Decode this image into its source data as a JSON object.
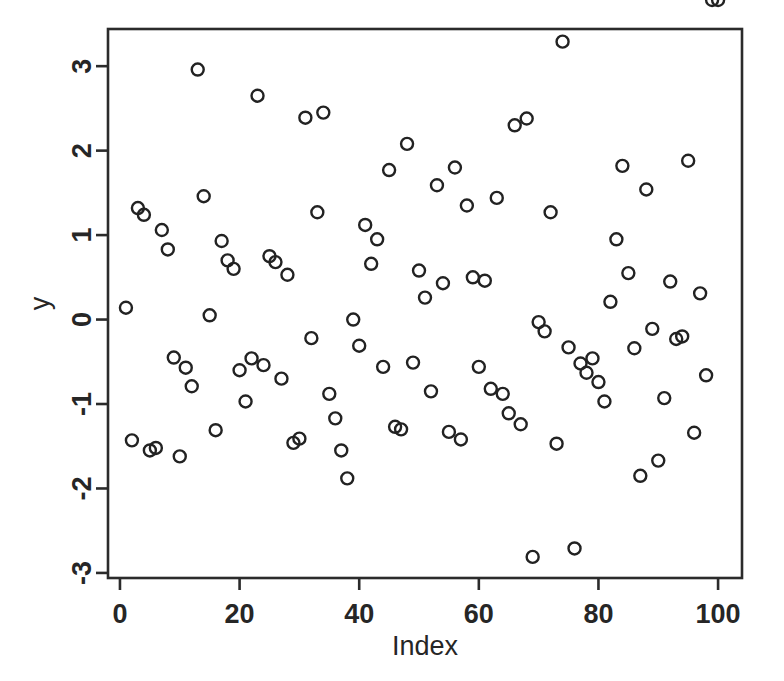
{
  "figure": {
    "background_color": "#ffffff",
    "foreground_color": "#262626",
    "point_color": "#222222",
    "title": ""
  },
  "chart_data": {
    "type": "scatter",
    "title": "",
    "xlabel": "Index",
    "ylabel": "y",
    "xlim": [
      -2,
      104
    ],
    "ylim": [
      -3.06,
      3.44
    ],
    "grid": false,
    "legend": null,
    "marker": "open-circle",
    "xticks": [
      0,
      20,
      40,
      60,
      80,
      100
    ],
    "xtick_labels": [
      "0",
      "20",
      "40",
      "60",
      "80",
      "100"
    ],
    "yticks": [
      -3,
      -2,
      -1,
      0,
      1,
      2,
      3
    ],
    "ytick_labels": [
      "-3",
      "-2",
      "-1",
      "0",
      "1",
      "2",
      "3"
    ],
    "n_points": 100,
    "x": [
      1,
      2,
      3,
      4,
      5,
      6,
      7,
      8,
      9,
      10,
      11,
      12,
      13,
      14,
      15,
      16,
      17,
      18,
      19,
      20,
      21,
      22,
      23,
      24,
      25,
      26,
      27,
      28,
      29,
      30,
      31,
      32,
      33,
      34,
      35,
      36,
      37,
      38,
      39,
      40,
      41,
      42,
      43,
      44,
      45,
      46,
      47,
      48,
      49,
      50,
      51,
      52,
      53,
      54,
      55,
      56,
      57,
      58,
      59,
      60,
      61,
      62,
      63,
      64,
      65,
      66,
      67,
      68,
      69,
      70,
      71,
      72,
      73,
      74,
      75,
      76,
      77,
      78,
      79,
      80,
      81,
      82,
      83,
      84,
      85,
      86,
      87,
      88,
      89,
      90,
      91,
      92,
      93,
      94,
      95,
      96,
      97,
      98,
      99,
      100
    ],
    "y": [
      0.14,
      -1.43,
      1.32,
      1.24,
      -1.55,
      -1.52,
      1.06,
      0.83,
      -0.45,
      -1.62,
      -0.57,
      -0.79,
      2.96,
      1.46,
      0.05,
      -1.31,
      0.93,
      0.7,
      0.6,
      -0.6,
      -0.97,
      -0.46,
      2.65,
      -0.54,
      0.75,
      0.68,
      -0.7,
      0.53,
      -1.46,
      -1.41,
      2.39,
      -0.22,
      1.27,
      2.45,
      -0.88,
      -1.17,
      -1.55,
      -1.88,
      0.0,
      -0.31,
      1.12,
      0.66,
      0.95,
      -0.56,
      1.77,
      -1.27,
      -1.3,
      2.08,
      -0.51,
      0.58,
      0.26,
      -0.85,
      1.59,
      0.43,
      -1.33,
      1.8,
      -1.42,
      1.35,
      0.5,
      -0.56,
      0.46,
      -0.82,
      1.44,
      -0.88,
      -1.11,
      2.3,
      -1.24,
      2.38,
      -2.81,
      -0.03,
      -0.14,
      1.27,
      -1.47,
      3.29,
      -0.33,
      -2.71,
      -0.52,
      -0.63,
      -0.46,
      -0.74,
      -0.97,
      0.21,
      0.95,
      1.82,
      0.55,
      -0.34,
      -1.85,
      1.54,
      -0.11,
      -1.67,
      -0.93,
      0.45,
      -0.23,
      -0.2,
      1.88,
      -1.34,
      0.31,
      -0.66
    ],
    "marker_radius_px": 6
  },
  "geometry": {
    "plot_left": 108,
    "plot_right": 742,
    "plot_top": 29,
    "plot_bottom": 578
  }
}
